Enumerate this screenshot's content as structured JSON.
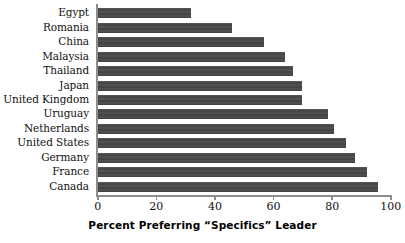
{
  "chart_data": {
    "type": "bar",
    "orientation": "horizontal",
    "title": "",
    "xlabel": "Percent Preferring “Specifics” Leader",
    "ylabel": "",
    "xlim": [
      0,
      100
    ],
    "xticks": [
      0,
      20,
      40,
      60,
      80,
      100
    ],
    "xtick_labels": [
      "0",
      "20",
      "40",
      "60",
      "80",
      "100"
    ],
    "grid": false,
    "legend": null,
    "bar_color": "#4b4b4b",
    "axis_color": "#8d8d8d",
    "categories": [
      "Egypt",
      "Romania",
      "China",
      "Malaysia",
      "Thailand",
      "Japan",
      "United Kingdom",
      "Uruguay",
      "Netherlands",
      "United States",
      "Germany",
      "France",
      "Canada"
    ],
    "values": [
      32,
      46,
      57,
      64,
      67,
      70,
      70,
      79,
      81,
      85,
      88,
      92,
      96
    ]
  }
}
